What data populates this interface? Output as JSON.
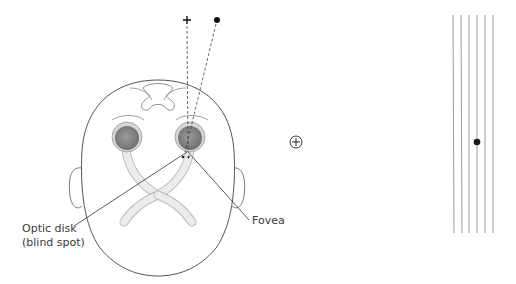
{
  "diagram": {
    "type": "blind-spot-demonstration",
    "labels": {
      "optic_disk_line1": "Optic disk",
      "optic_disk_line2": "(blind spot)",
      "fovea": "Fovea"
    },
    "targets": {
      "fixation_symbol": "+",
      "blind_spot_symbol": "●",
      "test_fixation_symbol": "⊕"
    },
    "grid_lines_count": 6,
    "colors": {
      "outline": "#555555",
      "eyeball": "#8a8a8a",
      "optic_nerve": "#e6e6e6",
      "grid_line": "#9a9a9a",
      "dot": "#1a1a1a"
    }
  }
}
